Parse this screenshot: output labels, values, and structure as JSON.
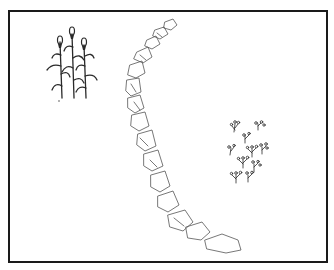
{
  "illustration": {
    "frame": {
      "border_color": "#1a1a1a",
      "background": "#ffffff"
    },
    "elements": [
      {
        "id": "corn-plants",
        "label": "corn stalks",
        "count": 3
      },
      {
        "id": "stone-chain",
        "label": "curved chain of stones",
        "count": 13
      },
      {
        "id": "seedling-cluster",
        "label": "cluster of small flowering plants"
      }
    ],
    "ink_color": "#2a2a2a"
  }
}
